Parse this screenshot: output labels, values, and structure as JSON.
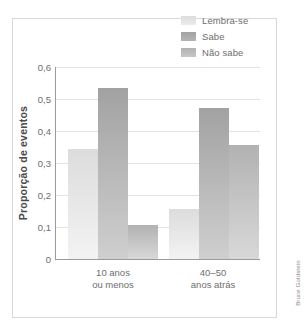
{
  "credit": "Bruce Goldstein",
  "legend": {
    "position": "top-right",
    "items": [
      {
        "label": "Lembra-se",
        "color": "#d9d9d9"
      },
      {
        "label": "Sabe",
        "color": "#a8a8a8"
      },
      {
        "label": "Não sabe",
        "color": "#bcbcbc"
      }
    ]
  },
  "axes": {
    "ylabel": "Proporção de eventos",
    "xlabel": "",
    "yticks": [
      "0,6",
      "0,5",
      "0,4",
      "0,3",
      "0,2",
      "0,1",
      "0"
    ],
    "ytick_values": [
      0.6,
      0.5,
      0.4,
      0.3,
      0.2,
      0.1,
      0
    ],
    "ymin": 0,
    "ymax": 0.6,
    "grid": true
  },
  "categories_display": [
    {
      "line1": "10 anos",
      "line2": "ou menos"
    },
    {
      "line1": "40–50",
      "line2": "anos atrás"
    }
  ],
  "chart_data": {
    "type": "bar",
    "title": "",
    "subtitle": "",
    "xlabel": "",
    "ylabel": "Proporção de eventos",
    "ylim": [
      0,
      0.6
    ],
    "grid": true,
    "legend_position": "top-right",
    "categories": [
      "10 anos ou menos",
      "40–50 anos atrás"
    ],
    "series": [
      {
        "name": "Lembra-se",
        "color": "#d9d9d9",
        "values": [
          0.345,
          0.155
        ]
      },
      {
        "name": "Sabe",
        "color": "#a8a8a8",
        "values": [
          0.535,
          0.472
        ]
      },
      {
        "name": "Não sabe",
        "color": "#bcbcbc",
        "values": [
          0.105,
          0.355
        ]
      }
    ],
    "annotations": [
      "Bruce Goldstein"
    ]
  }
}
